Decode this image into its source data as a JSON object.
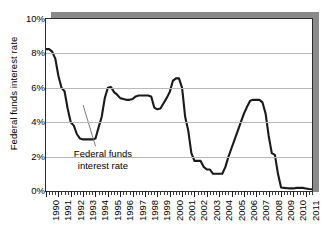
{
  "chart_data": {
    "type": "line",
    "title": "",
    "xlabel": "",
    "ylabel": "Federal funds interest rate",
    "ylim": [
      0,
      10
    ],
    "xlim": [
      1990,
      2011.5
    ],
    "grid": true,
    "legend": "none",
    "y_tick_labels": [
      "10%",
      "8%",
      "6%",
      "4%",
      "2%",
      "0%"
    ],
    "y_tick_values": [
      10,
      8,
      6,
      4,
      2,
      0
    ],
    "x_tick_labels": [
      "1990",
      "1991",
      "1992",
      "1993",
      "1994",
      "1995",
      "1996",
      "1997",
      "1998",
      "1999",
      "2000",
      "2001",
      "2002",
      "2003",
      "2004",
      "2005",
      "2006",
      "2007",
      "2008",
      "2009",
      "2010",
      "2011"
    ],
    "x_tick_values": [
      1990,
      1991,
      1992,
      1993,
      1994,
      1995,
      1996,
      1997,
      1998,
      1999,
      2000,
      2001,
      2002,
      2003,
      2004,
      2005,
      2006,
      2007,
      2008,
      2009,
      2010,
      2011
    ],
    "annotations": [
      {
        "name": "series-callout",
        "line1": "Federal funds",
        "line2": "interest rate",
        "text_x": 1994.6,
        "text_y": 2.15,
        "leader_from_x": 1994.0,
        "leader_from_y": 2.6,
        "leader_to_x": 1993.0,
        "leader_to_y": 5.0
      }
    ],
    "series": [
      {
        "name": "Federal funds interest rate",
        "color": "#1a1a1a",
        "x": [
          1990.0,
          1990.25,
          1990.5,
          1990.75,
          1991.0,
          1991.25,
          1991.5,
          1991.75,
          1992.0,
          1992.25,
          1992.5,
          1992.75,
          1993.0,
          1993.25,
          1993.5,
          1993.75,
          1994.0,
          1994.25,
          1994.5,
          1994.75,
          1995.0,
          1995.25,
          1995.5,
          1995.75,
          1996.0,
          1996.25,
          1996.5,
          1996.75,
          1997.0,
          1997.25,
          1997.5,
          1997.75,
          1998.0,
          1998.25,
          1998.5,
          1998.75,
          1999.0,
          1999.25,
          1999.5,
          1999.75,
          2000.0,
          2000.25,
          2000.5,
          2000.75,
          2001.0,
          2001.25,
          2001.5,
          2001.75,
          2002.0,
          2002.25,
          2002.5,
          2002.75,
          2003.0,
          2003.25,
          2003.5,
          2003.75,
          2004.0,
          2004.25,
          2004.5,
          2004.75,
          2005.0,
          2005.25,
          2005.5,
          2005.75,
          2006.0,
          2006.25,
          2006.5,
          2006.75,
          2007.0,
          2007.25,
          2007.5,
          2007.75,
          2008.0,
          2008.25,
          2008.5,
          2008.75,
          2009.0,
          2009.25,
          2009.5,
          2009.75,
          2010.0,
          2010.25,
          2010.5,
          2010.75,
          2011.0,
          2011.25,
          2011.5
        ],
        "y": [
          8.25,
          8.25,
          8.1,
          7.7,
          6.7,
          6.0,
          5.8,
          4.8,
          4.0,
          3.8,
          3.3,
          3.05,
          3.0,
          3.0,
          3.0,
          3.0,
          3.05,
          3.7,
          4.3,
          5.4,
          6.0,
          6.05,
          5.75,
          5.6,
          5.4,
          5.35,
          5.3,
          5.3,
          5.35,
          5.5,
          5.55,
          5.55,
          5.55,
          5.55,
          5.5,
          4.85,
          4.75,
          4.8,
          5.1,
          5.4,
          5.75,
          6.4,
          6.55,
          6.55,
          6.0,
          4.3,
          3.5,
          2.2,
          1.75,
          1.75,
          1.75,
          1.4,
          1.25,
          1.25,
          1.0,
          1.0,
          1.0,
          1.0,
          1.4,
          2.0,
          2.5,
          3.0,
          3.5,
          4.0,
          4.5,
          4.9,
          5.25,
          5.3,
          5.3,
          5.3,
          5.15,
          4.5,
          3.2,
          2.2,
          2.1,
          1.0,
          0.2,
          0.18,
          0.16,
          0.15,
          0.15,
          0.18,
          0.18,
          0.18,
          0.15,
          0.12,
          0.1
        ]
      }
    ]
  },
  "axis": {
    "y_title": "Federal funds interest rate"
  }
}
